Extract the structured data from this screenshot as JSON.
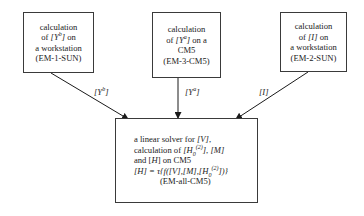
{
  "diagram": {
    "type": "flow",
    "nodes": [
      {
        "id": "em1",
        "lines": [
          "calculation",
          "of [Y^b] on",
          "a workstation",
          "(EM-1-SUN)"
        ],
        "pre": "of ",
        "var": "[Y",
        "sup": "b",
        "var_end": "]",
        "post": " on",
        "line1": "calculation",
        "line3": "a workstation",
        "line4": "(EM-1-SUN)"
      },
      {
        "id": "em3",
        "lines": [
          "calculation",
          "of [Y^a] on a",
          "CM5",
          "(EM-3-CM5)"
        ],
        "line1": "calculation",
        "pre": "of ",
        "var": "[Y",
        "sup": "a",
        "var_end": "]",
        "post": " on a",
        "line3": "CM5",
        "line4": "(EM-3-CM5)"
      },
      {
        "id": "em2",
        "lines": [
          "calculation",
          "of [I] on",
          "a workstation",
          "(EM-2-SUN)"
        ],
        "line1": "calculation",
        "pre": "of ",
        "var": "[I]",
        "post": " on",
        "line3": "a workstation",
        "line4": "(EM-2-SUN)"
      },
      {
        "id": "emall",
        "lines": [
          "a linear solver for [V],",
          "calculation of [H0^(2)], [M]",
          "and [H] on CM5",
          "[H] = τ{f([V],[M],[H0^(2)])}",
          "(EM-all-CM5)"
        ],
        "l1_pre": "a linear solver for ",
        "l1_var": "[V]",
        "l1_post": ",",
        "l2_pre": "calculation of ",
        "l2_var": "[H",
        "l2_sub": "0",
        "l2_sup": "(2)",
        "l2_mid": "]",
        "l2_post": ", ",
        "l2_var2": "[M]",
        "l3_pre": "and [",
        "l3_var": "H",
        "l3_post": "] on CM5",
        "l4_a": "[H] = ",
        "l4_tau": "τ",
        "l4_b": "{f([V],[M],[H",
        "l4_sub": "0",
        "l4_sup": "(2)",
        "l4_c": "])}",
        "line5": "(EM-all-CM5)"
      }
    ],
    "edges": [
      {
        "from": "em1",
        "to": "emall",
        "label_base": "[Y",
        "label_sup": "b",
        "label_end": "]"
      },
      {
        "from": "em3",
        "to": "emall",
        "label_base": "[Y",
        "label_sup": "a",
        "label_end": "]"
      },
      {
        "from": "em2",
        "to": "emall",
        "label": "[I]"
      }
    ]
  }
}
